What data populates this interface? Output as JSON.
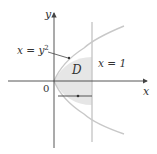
{
  "diagram": {
    "type": "region-of-integration",
    "axes": {
      "x_label": "x",
      "y_label": "y",
      "origin_label": "0"
    },
    "curves": [
      {
        "name": "parabola",
        "equation_label": "x = y²",
        "lhs": "x = y",
        "exponent": "2"
      },
      {
        "name": "vertical-line",
        "equation_label": "x = 1"
      }
    ],
    "region": {
      "label": "D",
      "fill_color": "#e6e6e6"
    },
    "colors": {
      "axis": "#444444",
      "curve": "#c8c8c8",
      "line": "#c8c8c8",
      "arrow_segment": "#555555"
    }
  }
}
